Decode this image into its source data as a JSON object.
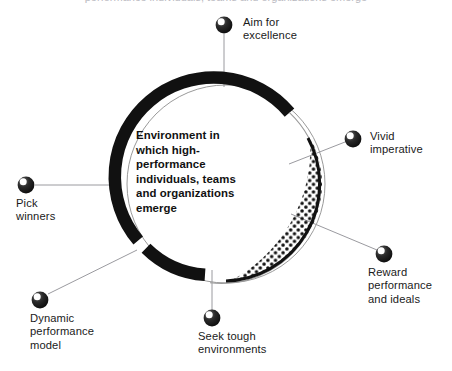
{
  "figure": {
    "width": 452,
    "height": 371,
    "background": "#ffffff",
    "top_caption": "performance individuals, teams and organizations emerge"
  },
  "center": {
    "text": "Environment in\nwhich  high-\nperformance\nindividuals, teams\nand organizations\nemerge"
  },
  "ring": {
    "outline_color": "#9a9a9a",
    "arc_color": "#111111",
    "dot_color": "#111111",
    "center_x": 226,
    "center_y": 184,
    "outer_radius": 99,
    "arc_thickness": 12
  },
  "nodes": [
    {
      "id": "aim-for-excellence",
      "label": "Aim for\nexcellence",
      "bullet_x": 224,
      "bullet_y": 25,
      "label_x": 243,
      "label_y": 16,
      "line": {
        "x1": 224,
        "y1": 34,
        "x2": 224,
        "y2": 87
      }
    },
    {
      "id": "vivid-imperative",
      "label": "Vivid\nimperative",
      "bullet_x": 353,
      "bullet_y": 139,
      "label_x": 370,
      "label_y": 130,
      "line": {
        "x1": 345,
        "y1": 142,
        "x2": 292,
        "y2": 163
      }
    },
    {
      "id": "reward-performance-and-ideals",
      "label": "Reward\nperformance\nand ideals",
      "bullet_x": 384,
      "bullet_y": 254,
      "label_x": 368,
      "label_y": 268,
      "line": {
        "x1": 377,
        "y1": 250,
        "x2": 294,
        "y2": 215
      }
    },
    {
      "id": "seek-tough-environments",
      "label": "Seek tough\nenvironments",
      "bullet_x": 212,
      "bullet_y": 318,
      "label_x": 198,
      "label_y": 331,
      "line": {
        "x1": 212,
        "y1": 310,
        "x2": 212,
        "y2": 272
      }
    },
    {
      "id": "dynamic-performance-model",
      "label": "Dynamic\nperformance\nmodel",
      "bullet_x": 40,
      "bullet_y": 300,
      "label_x": 30,
      "label_y": 313,
      "line": {
        "x1": 47,
        "y1": 295,
        "x2": 136,
        "y2": 251
      }
    },
    {
      "id": "pick-winners",
      "label": "Pick\nwinners",
      "bullet_x": 26,
      "bullet_y": 185,
      "label_x": 16,
      "label_y": 198,
      "line": {
        "x1": 34,
        "y1": 185,
        "x2": 114,
        "y2": 185
      }
    }
  ]
}
